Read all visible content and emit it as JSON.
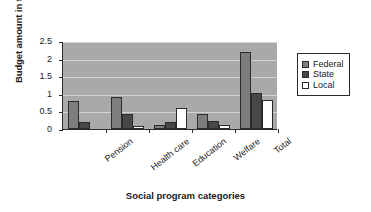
{
  "chart_data": {
    "type": "bar",
    "title": "",
    "xlabel": "Social program categories",
    "ylabel": "Budget amount in trillions",
    "categories": [
      "Pension",
      "Health care",
      "Education",
      "Welfare",
      "Total"
    ],
    "series": [
      {
        "name": "Federal",
        "color": "#7d7d7d",
        "values": [
          0.8,
          0.9,
          0.1,
          0.44,
          2.2
        ]
      },
      {
        "name": "State",
        "color": "#474747",
        "values": [
          0.2,
          0.42,
          0.2,
          0.22,
          1.02
        ]
      },
      {
        "name": "Local",
        "color": "#ffffff",
        "values": [
          0.0,
          0.08,
          0.6,
          0.1,
          0.82
        ]
      }
    ],
    "ylim": [
      0,
      2.5
    ],
    "yticks": [
      "0",
      "0.5",
      "1",
      "1.5",
      "2",
      "2.5"
    ],
    "ytick_values": [
      0,
      0.5,
      1,
      1.5,
      2,
      2.5
    ],
    "grid": true,
    "legend_position": "right",
    "plot_background": "#a9a9a9",
    "gridline_color": "#d3d3d3",
    "axis_color": "#2b2b2b"
  },
  "legend": {
    "items": [
      {
        "label": "Federal"
      },
      {
        "label": "State"
      },
      {
        "label": "Local"
      }
    ]
  }
}
